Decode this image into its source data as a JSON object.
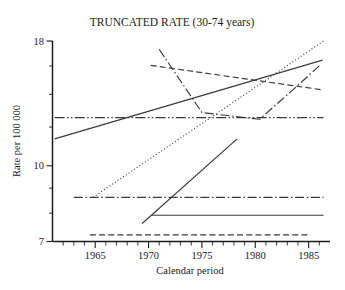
{
  "chart_data": {
    "type": "line",
    "title": "TRUNCATED RATE (30-74 years)",
    "xlabel": "Calendar period",
    "ylabel": "Rate per 100 000",
    "xlim": [
      1961,
      1987
    ],
    "ylim": [
      7,
      18
    ],
    "yscale": "log",
    "grid": false,
    "legend": "none",
    "xticks": [
      1965,
      1970,
      1975,
      1980,
      1985
    ],
    "xtick_labels": [
      "1965",
      "1970",
      "1975",
      "1980",
      "1985"
    ],
    "xminor_ticks": [
      1962,
      1963,
      1964,
      1966,
      1967,
      1968,
      1969,
      1971,
      1972,
      1973,
      1974,
      1976,
      1977,
      1978,
      1979,
      1981,
      1982,
      1983,
      1984,
      1986
    ],
    "yticks": [
      7,
      10,
      18
    ],
    "ytick_labels": [
      "7",
      "10",
      "18"
    ],
    "yminor_ticks": [
      8,
      9,
      12,
      14,
      16
    ],
    "series": [
      {
        "name": "rising-solid-long",
        "style": "solid",
        "x": [
          1961.2,
          1986.3
        ],
        "values": [
          11.35,
          16.45
        ]
      },
      {
        "name": "flat-dash-dot-dot-upper",
        "style": "dash-dot-dot",
        "x": [
          1961.2,
          1986.4
        ],
        "values": [
          12.55,
          12.55
        ]
      },
      {
        "name": "steep-dotted",
        "style": "dotted",
        "x": [
          1964.8,
          1986.4
        ],
        "values": [
          8.62,
          18.0
        ]
      },
      {
        "name": "declining-dashed",
        "style": "dashed",
        "x": [
          1970.2,
          1986.3
        ],
        "values": [
          16.05,
          14.3
        ]
      },
      {
        "name": "zigzag-dash-dot",
        "style": "dash-dot",
        "x": [
          1971.0,
          1975.0,
          1980.4,
          1983.6,
          1986.2
        ],
        "values": [
          17.3,
          12.85,
          12.45,
          14.35,
          16.15
        ]
      },
      {
        "name": "flat-dash-dot-lower",
        "style": "dash-dot",
        "x": [
          1963.0,
          1986.4
        ],
        "values": [
          8.62,
          8.62
        ]
      },
      {
        "name": "rising-solid-short",
        "style": "solid",
        "x": [
          1969.4,
          1978.3
        ],
        "values": [
          7.62,
          11.35
        ]
      },
      {
        "name": "flat-solid-lower",
        "style": "solid",
        "x": [
          1970.3,
          1986.4
        ],
        "values": [
          7.92,
          7.92
        ]
      },
      {
        "name": "flat-dashed-bottom",
        "style": "dashed",
        "x": [
          1964.5,
          1985.2
        ],
        "values": [
          7.22,
          7.22
        ]
      }
    ]
  }
}
